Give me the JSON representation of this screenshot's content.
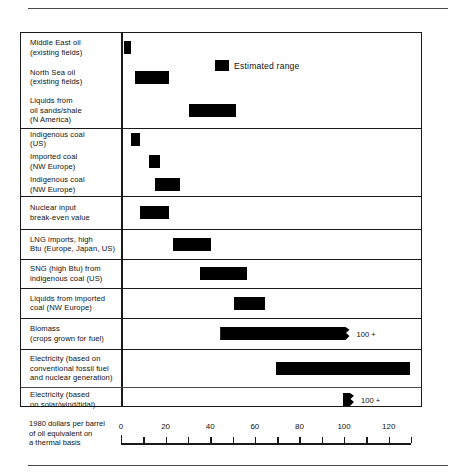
{
  "rules": {
    "top": "horizontal-rule",
    "bottom": "horizontal-rule"
  },
  "legend": {
    "label": "Estimated range",
    "swatch_color": "#000000"
  },
  "axis": {
    "caption_lines": [
      "1980 dollars per barrel",
      "of oil equivalent on",
      "a thermal basis"
    ],
    "ticks": [
      0,
      10,
      20,
      30,
      40,
      50,
      60,
      70,
      80,
      90,
      100,
      110,
      120,
      130
    ],
    "labeled_ticks": [
      0,
      20,
      40,
      60,
      80,
      100,
      120
    ],
    "min": 0,
    "max": 130
  },
  "chart_data": {
    "type": "bar",
    "orientation": "horizontal",
    "subtype": "range",
    "title": "",
    "xlabel": "1980 dollars per barrel of oil equivalent on a thermal basis",
    "ylabel": "",
    "xlim": [
      0,
      130
    ],
    "grid": false,
    "legend": "Estimated range",
    "legend_position": "top-right",
    "groups": [
      {
        "name": "oil-and-liquids",
        "rows": [
          {
            "label_lines": [
              "Middle East oil",
              "(existing fields)"
            ],
            "low": 1,
            "high": 4,
            "note": ""
          },
          {
            "label_lines": [
              "North Sea oil",
              "(existing fields)"
            ],
            "low": 6,
            "high": 21,
            "note": ""
          },
          {
            "label_lines": [
              "Liquids from",
              "oil sands/shale",
              "(N America)"
            ],
            "low": 30,
            "high": 51,
            "note": ""
          }
        ]
      },
      {
        "name": "coal",
        "rows": [
          {
            "label_lines": [
              "Indigenous coal",
              "(US)"
            ],
            "low": 4,
            "high": 8,
            "note": ""
          },
          {
            "label_lines": [
              "Imported coal",
              "(NW Europe)"
            ],
            "low": 12,
            "high": 17,
            "note": ""
          },
          {
            "label_lines": [
              "Indigenous coal",
              "(NW Europe)"
            ],
            "low": 15,
            "high": 26,
            "note": ""
          }
        ]
      },
      {
        "name": "nuclear",
        "rows": [
          {
            "label_lines": [
              "Nuclear input",
              "break-even value"
            ],
            "low": 8,
            "high": 21,
            "note": ""
          }
        ]
      },
      {
        "name": "lng",
        "rows": [
          {
            "label_lines": [
              "LNG imports, high",
              "Btu (Europe, Japan, US)"
            ],
            "low": 23,
            "high": 40,
            "note": ""
          }
        ]
      },
      {
        "name": "sng",
        "rows": [
          {
            "label_lines": [
              "SNG (high Btu) from",
              "indigenous coal (US)"
            ],
            "low": 35,
            "high": 56,
            "note": ""
          }
        ]
      },
      {
        "name": "coal-liquids",
        "rows": [
          {
            "label_lines": [
              "Liquids from imported",
              "coal (NW Europe)"
            ],
            "low": 50,
            "high": 64,
            "note": ""
          }
        ]
      },
      {
        "name": "biomass",
        "rows": [
          {
            "label_lines": [
              "Biomass",
              "(crops grown for fuel)"
            ],
            "low": 44,
            "high": 102,
            "note": "100 +",
            "ragged": true
          }
        ]
      },
      {
        "name": "electricity",
        "rows": [
          {
            "label_lines": [
              "Electricity (based on",
              "conventional fossil fuel",
              "and nuclear generation)"
            ],
            "low": 69,
            "high": 129,
            "note": ""
          },
          {
            "label_lines": [
              "Electricity (based",
              "on solar/wind/tidal)"
            ],
            "low": 99,
            "high": 104,
            "note": "100 +",
            "ragged": true
          }
        ]
      }
    ]
  }
}
